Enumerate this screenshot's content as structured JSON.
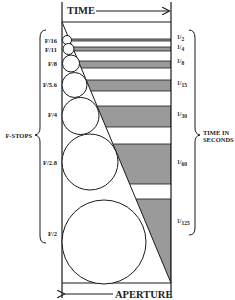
{
  "diagram": {
    "top_label": "TIME",
    "bottom_label": "APERTURE",
    "left_group_label": "F-STOPS",
    "right_group_label_line1": "TIME IN",
    "right_group_label_line2": "SECONDS",
    "shade_color": "#9a9a9a",
    "line_color": "#1a1a1a",
    "rows": [
      {
        "fstop": "F/16",
        "time_num": "1",
        "time_den": "2"
      },
      {
        "fstop": "F/11",
        "time_num": "1",
        "time_den": "4"
      },
      {
        "fstop": "F/8",
        "time_num": "1",
        "time_den": "8"
      },
      {
        "fstop": "F/5.6",
        "time_num": "1",
        "time_den": "15"
      },
      {
        "fstop": "F/4",
        "time_num": "1",
        "time_den": "30"
      },
      {
        "fstop": "F/2.8",
        "time_num": "1",
        "time_den": "60"
      },
      {
        "fstop": "F/2",
        "time_num": "1",
        "time_den": "125"
      }
    ]
  }
}
